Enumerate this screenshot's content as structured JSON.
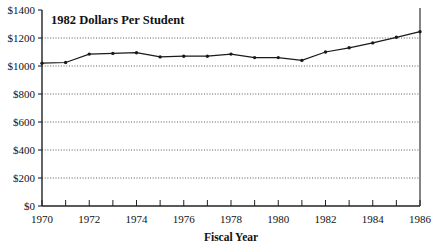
{
  "chart_data": {
    "type": "line",
    "title": "1982 Dollars Per Student",
    "xlabel": "Fiscal Year",
    "ylabel": "",
    "xlim": [
      1970,
      1986
    ],
    "ylim": [
      0,
      1400
    ],
    "grid": true,
    "legend": "none",
    "marker": "dot",
    "line_color": "#1a1a1a",
    "grid_color": "#444444",
    "x": [
      1970,
      1971,
      1972,
      1973,
      1974,
      1975,
      1976,
      1977,
      1978,
      1979,
      1980,
      1981,
      1982,
      1983,
      1984,
      1985,
      1986
    ],
    "values": [
      1020,
      1025,
      1085,
      1090,
      1095,
      1065,
      1070,
      1070,
      1085,
      1060,
      1060,
      1040,
      1100,
      1130,
      1165,
      1205,
      1245
    ],
    "series": [
      {
        "name": "1982 Dollars Per Student",
        "values": [
          1020,
          1025,
          1085,
          1090,
          1095,
          1065,
          1070,
          1070,
          1085,
          1060,
          1060,
          1040,
          1100,
          1130,
          1165,
          1205,
          1245
        ]
      }
    ],
    "y_ticks": [
      0,
      200,
      400,
      600,
      800,
      1000,
      1200,
      1400
    ],
    "y_tick_labels": [
      "$0",
      "$200",
      "$400",
      "$600",
      "$800",
      "$1000",
      "$1200",
      "$1400"
    ],
    "x_ticks": [
      1970,
      1971,
      1972,
      1973,
      1974,
      1975,
      1976,
      1977,
      1978,
      1979,
      1980,
      1981,
      1982,
      1983,
      1984,
      1985,
      1986
    ],
    "x_tick_labels": [
      "1970",
      "",
      "1972",
      "",
      "1974",
      "",
      "1976",
      "",
      "1978",
      "",
      "1980",
      "",
      "1982",
      "",
      "1984",
      "",
      "1986"
    ],
    "x_labeled_ticks": [
      {
        "year": 1970,
        "label": "1970"
      },
      {
        "year": 1972,
        "label": "1972"
      },
      {
        "year": 1974,
        "label": "1974"
      },
      {
        "year": 1976,
        "label": "1976"
      },
      {
        "year": 1978,
        "label": "1978"
      },
      {
        "year": 1980,
        "label": "1980"
      },
      {
        "year": 1982,
        "label": "1982"
      },
      {
        "year": 1984,
        "label": "1984"
      },
      {
        "year": 1986,
        "label": "1986"
      }
    ]
  }
}
